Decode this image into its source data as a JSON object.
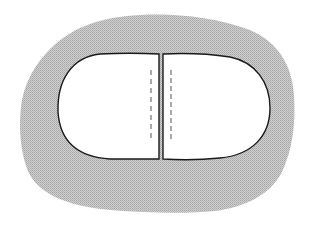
{
  "diagram": {
    "colors": {
      "background": "#ffffff",
      "surround_fill": "#c8c8c8",
      "surround_stipple": "#a9a9a9",
      "halves_fill": "#ffffff",
      "outline": "#1a1a1a",
      "dash_line": "#555555"
    },
    "elements": [
      {
        "id": "surround",
        "label": "gray stippled region"
      },
      {
        "id": "left-half",
        "label": "left white half"
      },
      {
        "id": "right-half",
        "label": "right white half"
      },
      {
        "id": "left-dashed-line",
        "label": "dashed line in left half"
      },
      {
        "id": "right-dashed-line",
        "label": "dashed line in right half"
      }
    ]
  }
}
